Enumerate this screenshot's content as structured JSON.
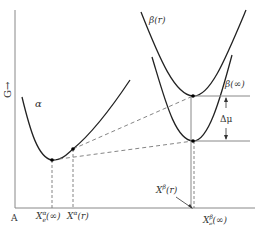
{
  "diagram": {
    "axis": {
      "y_label": "G→",
      "origin_label": "A"
    },
    "curves": {
      "alpha": {
        "label": "α"
      },
      "beta_r": {
        "label": "β(r)"
      },
      "beta_inf": {
        "label": "β(∞)"
      }
    },
    "annotations": {
      "delta_mu": "Δμ",
      "x_alpha_e_inf_main": "X",
      "x_alpha_e_inf_sup": "α",
      "x_alpha_e_inf_sub": "e",
      "x_alpha_e_inf_arg": "(∞)",
      "x_alpha_r_main": "X",
      "x_alpha_r_sup": "α",
      "x_alpha_r_arg": "(r)",
      "x_beta_r_main": "X",
      "x_beta_r_sup": "β",
      "x_beta_r_arg": "(r)",
      "x_beta_e_inf_main": "X",
      "x_beta_e_inf_sup": "β",
      "x_beta_e_inf_sub": "e",
      "x_beta_e_inf_arg": "(∞)"
    },
    "colors": {
      "curve": "#222222",
      "dashed": "#777777",
      "axis": "#888888"
    }
  }
}
